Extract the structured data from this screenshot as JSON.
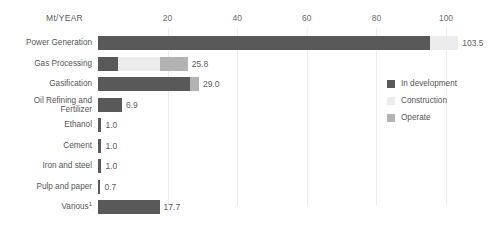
{
  "chart_data": {
    "type": "bar",
    "orientation": "horizontal",
    "stacked": true,
    "title": "",
    "unit_label": "Mt/YEAR",
    "xlabel": "",
    "ylabel": "",
    "xlim": [
      0,
      115
    ],
    "ticks": [
      20,
      40,
      60,
      80,
      100
    ],
    "tick_labels": [
      "20",
      "40",
      "60",
      "80",
      "100"
    ],
    "grid": true,
    "legend_position": "right",
    "series": [
      {
        "name": "In development",
        "color": "#595959",
        "values": [
          95.5,
          5.8,
          26.5,
          6.9,
          1.0,
          1.0,
          1.0,
          0.7,
          17.7
        ]
      },
      {
        "name": "Construction",
        "color": "#ececec",
        "values": [
          8.0,
          12.0,
          0.0,
          0.0,
          0.0,
          0.0,
          0.0,
          0.0,
          0.0
        ]
      },
      {
        "name": "Operate",
        "color": "#b3b3b3",
        "values": [
          0.0,
          8.0,
          2.5,
          0.0,
          0.0,
          0.0,
          0.0,
          0.0,
          0.0
        ]
      }
    ],
    "categories": [
      "Power Generation",
      "Gas Processing",
      "Gasification",
      "Oil Refining and Fertilizer",
      "Ethanol",
      "Cement",
      "Iron and steel",
      "Pulp and paper",
      "Various"
    ],
    "totals": [
      103.5,
      25.8,
      29.0,
      6.9,
      1.0,
      1.0,
      1.0,
      0.7,
      17.7
    ],
    "value_labels": [
      "103.5",
      "25.8",
      "29.0",
      "6.9",
      "1.0",
      "1.0",
      "1.0",
      "0.7",
      "17.7"
    ],
    "category_labels": [
      {
        "line1": "Power Generation",
        "line2": "",
        "superscript": ""
      },
      {
        "line1": "Gas Processing",
        "line2": "",
        "superscript": ""
      },
      {
        "line1": "Gasification",
        "line2": "",
        "superscript": ""
      },
      {
        "line1": "Oil Refining and",
        "line2": "Fertilizer",
        "superscript": ""
      },
      {
        "line1": "Ethanol",
        "line2": "",
        "superscript": ""
      },
      {
        "line1": "Cement",
        "line2": "",
        "superscript": ""
      },
      {
        "line1": "Iron and steel",
        "line2": "",
        "superscript": ""
      },
      {
        "line1": "Pulp and paper",
        "line2": "",
        "superscript": ""
      },
      {
        "line1": "Various",
        "line2": "",
        "superscript": "1"
      }
    ]
  },
  "legend": {
    "items": [
      {
        "label": "In development",
        "color": "#595959"
      },
      {
        "label": "Construction",
        "color": "#ececec"
      },
      {
        "label": "Operate",
        "color": "#b3b3b3"
      }
    ]
  },
  "colors": {
    "background": "#ffffff",
    "gridline": "#ededed",
    "text": "#555555",
    "tick_text": "#6d6d6d"
  }
}
